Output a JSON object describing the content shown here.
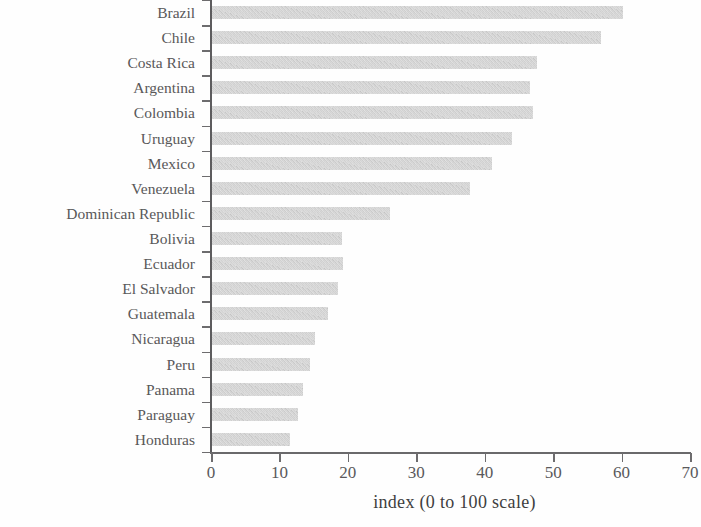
{
  "chart_data": {
    "type": "bar",
    "orientation": "horizontal",
    "title": "",
    "subtitle": "",
    "xlabel": "index (0 to 100 scale)",
    "ylabel": "",
    "xlim": [
      0,
      70
    ],
    "xticks": [
      0,
      10,
      20,
      30,
      40,
      50,
      60,
      70
    ],
    "xtick_labels": [
      "0",
      "10",
      "20",
      "30",
      "40",
      "50",
      "60",
      "70"
    ],
    "grid": false,
    "legend": null,
    "bar_color": "#c3c3c3",
    "axis_color": "#5d5c5e",
    "categories": [
      "Brazil",
      "Chile",
      "Costa Rica",
      "Argentina",
      "Colombia",
      "Uruguay",
      "Mexico",
      "Venezuela",
      "Dominican Republic",
      "Bolivia",
      "Ecuador",
      "El Salvador",
      "Guatemala",
      "Nicaragua",
      "Peru",
      "Panama",
      "Paraguay",
      "Honduras"
    ],
    "values": [
      60.2,
      57.0,
      47.7,
      46.6,
      47.1,
      44.0,
      41.1,
      37.9,
      26.2,
      19.2,
      19.3,
      18.6,
      17.1,
      15.2,
      14.5,
      13.5,
      12.7,
      11.5
    ]
  }
}
